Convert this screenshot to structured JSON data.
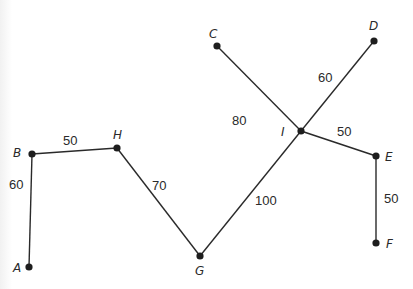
{
  "diagram": {
    "type": "weighted-graph",
    "nodes": [
      {
        "id": "A",
        "label": "A"
      },
      {
        "id": "B",
        "label": "B"
      },
      {
        "id": "C",
        "label": "C"
      },
      {
        "id": "D",
        "label": "D"
      },
      {
        "id": "E",
        "label": "E"
      },
      {
        "id": "F",
        "label": "F"
      },
      {
        "id": "G",
        "label": "G"
      },
      {
        "id": "H",
        "label": "H"
      },
      {
        "id": "I",
        "label": "I"
      }
    ],
    "edges": [
      {
        "from": "A",
        "to": "B",
        "weight": "60"
      },
      {
        "from": "B",
        "to": "H",
        "weight": "50"
      },
      {
        "from": "H",
        "to": "G",
        "weight": "70"
      },
      {
        "from": "G",
        "to": "I",
        "weight": "100"
      },
      {
        "from": "C",
        "to": "I",
        "weight": "80"
      },
      {
        "from": "D",
        "to": "I",
        "weight": "60"
      },
      {
        "from": "I",
        "to": "E",
        "weight": "50"
      },
      {
        "from": "E",
        "to": "F",
        "weight": "50"
      }
    ]
  }
}
